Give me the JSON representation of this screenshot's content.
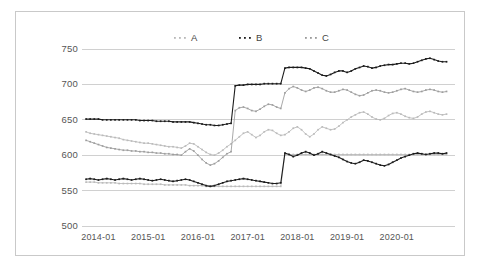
{
  "chart_data": {
    "type": "line",
    "title": "",
    "subtitle": "",
    "xlabel": "",
    "ylabel": "",
    "ylim": [
      500,
      750
    ],
    "yticks": [
      500,
      550,
      600,
      650,
      700,
      750
    ],
    "ytick_labels": [
      "500",
      "550",
      "600",
      "650",
      "700",
      "750"
    ],
    "xticks": [
      "2014-01",
      "2015-01",
      "2016-01",
      "2017-01",
      "2018-01",
      "2019-01",
      "2020-01"
    ],
    "xlim": [
      "2013-10",
      "2020-10"
    ],
    "grid": true,
    "grid_axis": "y",
    "legend_position": "top-center",
    "legend": [
      "A",
      "B",
      "C"
    ],
    "colors": {
      "A": "#b8b8b8",
      "B": "#1c1c1c",
      "C": "#9a9a9a",
      "grid": "#d0d0d0",
      "frame": "#c9c9c9",
      "text": "#555555"
    },
    "marker": "dot",
    "x_start": "2013-10",
    "x_step_months": 1,
    "series": [
      {
        "name": "A",
        "color": "#b8b8b8",
        "values": [
          633,
          631,
          630,
          629,
          628,
          627,
          626,
          625,
          624,
          622,
          621,
          620,
          619,
          618,
          617,
          617,
          616,
          615,
          614,
          613,
          612,
          612,
          611,
          610,
          613,
          617,
          616,
          612,
          608,
          604,
          601,
          600,
          603,
          607,
          612,
          616,
          621,
          626,
          631,
          633,
          629,
          625,
          628,
          633,
          636,
          635,
          631,
          628,
          629,
          633,
          638,
          640,
          636,
          630,
          626,
          630,
          636,
          640,
          638,
          636,
          637,
          641,
          646,
          650,
          654,
          657,
          660,
          661,
          658,
          654,
          651,
          650,
          652,
          656,
          659,
          660,
          658,
          655,
          653,
          652,
          654,
          658,
          661,
          662,
          660,
          658,
          657,
          658
        ]
      },
      {
        "name": "B",
        "color": "#1c1c1c",
        "values": [
          651,
          651,
          651,
          651,
          650,
          650,
          650,
          650,
          650,
          650,
          650,
          650,
          650,
          649,
          649,
          649,
          649,
          648,
          648,
          648,
          648,
          647,
          647,
          647,
          647,
          647,
          646,
          645,
          644,
          643,
          643,
          642,
          642,
          643,
          644,
          645,
          698,
          699,
          699,
          700,
          700,
          700,
          700,
          701,
          701,
          701,
          701,
          701,
          723,
          724,
          724,
          724,
          724,
          723,
          722,
          719,
          716,
          713,
          712,
          714,
          717,
          719,
          719,
          717,
          719,
          722,
          724,
          726,
          725,
          723,
          724,
          726,
          727,
          728,
          728,
          729,
          730,
          730,
          729,
          730,
          732,
          734,
          736,
          737,
          735,
          733,
          732,
          732
        ]
      },
      {
        "name": "C",
        "color": "#9a9a9a",
        "values": [
          621,
          619,
          617,
          615,
          613,
          611,
          610,
          609,
          608,
          607,
          607,
          606,
          606,
          605,
          605,
          604,
          604,
          603,
          603,
          602,
          602,
          601,
          601,
          600,
          605,
          609,
          606,
          600,
          594,
          589,
          586,
          588,
          592,
          597,
          602,
          605,
          663,
          667,
          668,
          666,
          663,
          662,
          665,
          669,
          672,
          671,
          668,
          666,
          688,
          694,
          697,
          695,
          692,
          690,
          692,
          695,
          696,
          694,
          691,
          689,
          689,
          691,
          693,
          692,
          689,
          686,
          684,
          685,
          688,
          691,
          692,
          691,
          689,
          688,
          689,
          691,
          693,
          694,
          692,
          690,
          689,
          690,
          692,
          693,
          692,
          690,
          689,
          690
        ]
      },
      {
        "name": "A-lower",
        "color": "#b8b8b8",
        "values": [
          562,
          562,
          562,
          561,
          561,
          561,
          561,
          561,
          560,
          560,
          560,
          560,
          560,
          560,
          559,
          559,
          559,
          559,
          559,
          558,
          558,
          558,
          558,
          558,
          558,
          557,
          557,
          557,
          557,
          556,
          556,
          556,
          556,
          556,
          556,
          556,
          556,
          556,
          556,
          556,
          556,
          556,
          556,
          556,
          556,
          556,
          556,
          556,
          601,
          601,
          601,
          601,
          601,
          601,
          601,
          601,
          601,
          601,
          601,
          601,
          601,
          601,
          601,
          601,
          601,
          601,
          601,
          601,
          601,
          601,
          601,
          601,
          601,
          601,
          601,
          601,
          601,
          601,
          601,
          601,
          601,
          601,
          601,
          601,
          601,
          601,
          601,
          601
        ]
      },
      {
        "name": "B-lower",
        "color": "#1c1c1c",
        "values": [
          566,
          567,
          566,
          565,
          566,
          567,
          566,
          565,
          566,
          567,
          566,
          565,
          566,
          567,
          566,
          565,
          564,
          565,
          566,
          565,
          564,
          563,
          564,
          565,
          566,
          565,
          563,
          561,
          559,
          557,
          556,
          557,
          559,
          561,
          563,
          564,
          565,
          566,
          567,
          566,
          565,
          564,
          563,
          562,
          561,
          560,
          560,
          561,
          603,
          601,
          598,
          600,
          603,
          605,
          603,
          600,
          602,
          605,
          603,
          601,
          599,
          597,
          594,
          591,
          589,
          588,
          590,
          593,
          592,
          590,
          588,
          586,
          585,
          587,
          590,
          593,
          596,
          598,
          600,
          602,
          603,
          602,
          601,
          602,
          603,
          603,
          602,
          603
        ]
      }
    ],
    "annotations": []
  },
  "axes": {
    "y_tick_labels": [
      "750",
      "700",
      "650",
      "600",
      "550",
      "500"
    ],
    "x_tick_labels": [
      "2014-01",
      "2015-01",
      "2016-01",
      "2017-01",
      "2018-01",
      "2019-01",
      "2020-01"
    ]
  },
  "legend": {
    "items": [
      {
        "label": "A",
        "color": "#b8b8b8"
      },
      {
        "label": "B",
        "color": "#1c1c1c"
      },
      {
        "label": "C",
        "color": "#9a9a9a"
      }
    ]
  }
}
